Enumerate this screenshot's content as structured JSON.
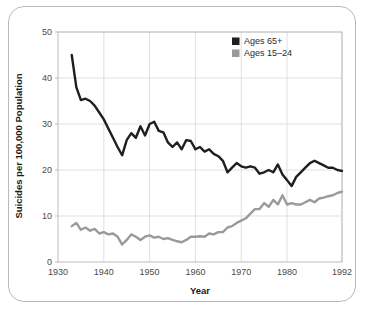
{
  "chart_data": {
    "type": "line",
    "title": "",
    "xlabel": "Year",
    "ylabel": "Suicides per 100,000 Population",
    "xlim": [
      1930,
      1992
    ],
    "ylim": [
      0,
      50
    ],
    "xticks": [
      1930,
      1940,
      1950,
      1960,
      1970,
      1980,
      1992
    ],
    "yticks": [
      0,
      10,
      20,
      30,
      40,
      50
    ],
    "grid": true,
    "legend_position": "top-right",
    "colors": {
      "series_1": "#1f1f1f",
      "series_2": "#9a9a9a",
      "grid": "#d8d8d8",
      "axis": "#bdbdbd",
      "frame": "#b9b9b9",
      "text": "#4a4a4a"
    },
    "x": [
      1933,
      1934,
      1935,
      1936,
      1937,
      1938,
      1939,
      1940,
      1941,
      1942,
      1943,
      1944,
      1945,
      1946,
      1947,
      1948,
      1949,
      1950,
      1951,
      1952,
      1953,
      1954,
      1955,
      1956,
      1957,
      1958,
      1959,
      1960,
      1961,
      1962,
      1963,
      1964,
      1965,
      1966,
      1967,
      1968,
      1969,
      1970,
      1971,
      1972,
      1973,
      1974,
      1975,
      1976,
      1977,
      1978,
      1979,
      1980,
      1981,
      1982,
      1983,
      1984,
      1985,
      1986,
      1987,
      1988,
      1989,
      1990,
      1991,
      1992
    ],
    "series": [
      {
        "name": "Ages 65+",
        "color": "#1f1f1f",
        "values": [
          45.0,
          38.0,
          35.2,
          35.5,
          35.0,
          34.0,
          32.5,
          31.0,
          29.0,
          27.0,
          25.0,
          23.2,
          26.5,
          28.0,
          27.0,
          29.5,
          27.5,
          30.0,
          30.5,
          28.5,
          28.2,
          26.0,
          25.0,
          26.0,
          24.5,
          26.5,
          26.3,
          24.5,
          25.0,
          24.0,
          24.5,
          23.5,
          23.0,
          22.0,
          19.5,
          20.5,
          21.5,
          20.8,
          20.5,
          20.8,
          20.5,
          19.2,
          19.5,
          20.0,
          19.5,
          21.2,
          19.0,
          17.8,
          16.5,
          18.5,
          19.5,
          20.5,
          21.5,
          22.0,
          21.5,
          21.0,
          20.5,
          20.5,
          20.0,
          19.8
        ]
      },
      {
        "name": "Ages 15–24",
        "color": "#9a9a9a",
        "values": [
          7.8,
          8.5,
          7.0,
          7.5,
          6.8,
          7.2,
          6.2,
          6.5,
          6.0,
          6.2,
          5.5,
          3.8,
          4.8,
          6.0,
          5.5,
          4.8,
          5.5,
          5.8,
          5.3,
          5.5,
          5.0,
          5.2,
          4.8,
          4.5,
          4.3,
          4.8,
          5.5,
          5.5,
          5.6,
          5.5,
          6.2,
          6.0,
          6.5,
          6.5,
          7.5,
          7.8,
          8.5,
          9.0,
          9.5,
          10.5,
          11.5,
          11.5,
          12.8,
          12.0,
          13.5,
          12.5,
          14.5,
          12.5,
          12.8,
          12.5,
          12.5,
          13.0,
          13.5,
          13.0,
          13.8,
          14.0,
          14.3,
          14.5,
          15.0,
          15.3
        ]
      }
    ]
  },
  "legend": {
    "items": [
      {
        "label": "Ages 65+",
        "color": "#1f1f1f"
      },
      {
        "label": "Ages 15–24",
        "color": "#9a9a9a"
      }
    ]
  },
  "axis_labels": {
    "y_title": "Suicides per 100,000 Population",
    "x_title": "Year"
  }
}
